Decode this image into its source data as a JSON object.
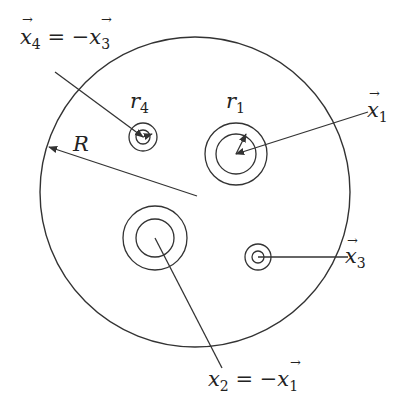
{
  "diagram": {
    "type": "geometric-schematic",
    "colors": {
      "stroke": "#333333",
      "background": "#ffffff",
      "text": "#222222"
    },
    "outer_circle": {
      "label": "R",
      "cx": 195,
      "cy": 192,
      "r": 155
    },
    "holes": [
      {
        "id": "x1",
        "cx": 236,
        "cy": 154,
        "r_inner": 20,
        "r_outer": 31,
        "radius_label": "r",
        "radius_sub": "1"
      },
      {
        "id": "x2",
        "cx": 155,
        "cy": 238,
        "r_inner": 19,
        "r_outer": 32,
        "radius_label": "",
        "radius_sub": ""
      },
      {
        "id": "x3",
        "cx": 258,
        "cy": 257,
        "r_inner": 6,
        "r_outer": 13,
        "radius_label": "",
        "radius_sub": ""
      },
      {
        "id": "x4",
        "cx": 143,
        "cy": 137,
        "r_inner": 7,
        "r_outer": 14,
        "radius_label": "r",
        "radius_sub": "4"
      }
    ],
    "labels": {
      "x4": {
        "base": "x",
        "sub": "4",
        "eq": " = −",
        "rhs_base": "x",
        "rhs_sub": "3"
      },
      "x1": {
        "base": "x",
        "sub": "1"
      },
      "x3": {
        "base": "x",
        "sub": "3"
      },
      "x2": {
        "base": "x",
        "sub": "2",
        "eq": " = −",
        "rhs_base": "x",
        "rhs_sub": "1"
      },
      "R": "R",
      "r1": {
        "base": "r",
        "sub": "1"
      },
      "r4": {
        "base": "r",
        "sub": "4"
      }
    }
  }
}
